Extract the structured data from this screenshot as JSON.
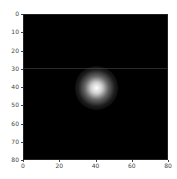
{
  "chart_data": {
    "type": "heatmap",
    "title": "",
    "xlabel": "",
    "ylabel": "",
    "xlim": [
      0,
      80
    ],
    "ylim": [
      80,
      0
    ],
    "x_ticks": [
      "0",
      "20",
      "40",
      "60",
      "80"
    ],
    "y_ticks": [
      "0",
      "10",
      "20",
      "30",
      "40",
      "50",
      "60",
      "70",
      "80"
    ],
    "colormap": "gray",
    "grid": false,
    "features": [
      {
        "kind": "gaussian_blob",
        "center_x": 40,
        "center_y": 40,
        "sigma": 4,
        "peak": "white"
      },
      {
        "kind": "faint_horizontal_line",
        "y": 29
      }
    ],
    "background_color": "#000000"
  }
}
